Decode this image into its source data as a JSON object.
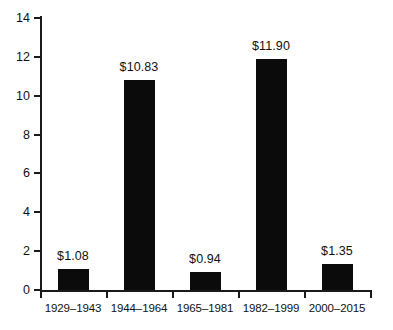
{
  "chart_data": {
    "type": "bar",
    "title": "",
    "subtitle": "",
    "xlabel": "",
    "ylabel": "",
    "categories": [
      "1929–1943",
      "1944–1964",
      "1965–1981",
      "1982–1999",
      "2000–2015"
    ],
    "values": [
      1.08,
      10.83,
      0.94,
      11.9,
      1.35
    ],
    "value_labels": [
      "$1.08",
      "$10.83",
      "$0.94",
      "$11.90",
      "$1.35"
    ],
    "ylim": [
      0,
      14
    ],
    "ytick_labels": [
      "0",
      "2",
      "4",
      "6",
      "8",
      "10",
      "12",
      "14"
    ],
    "ytick_values": [
      0,
      2,
      4,
      6,
      8,
      10,
      12,
      14
    ],
    "grid": false,
    "legend": false,
    "legend_position": "none",
    "bar_color": "#0b0b0b",
    "axis_color": "#1a1a1a",
    "text_color": "#111111",
    "background_color": "#ffffff"
  }
}
